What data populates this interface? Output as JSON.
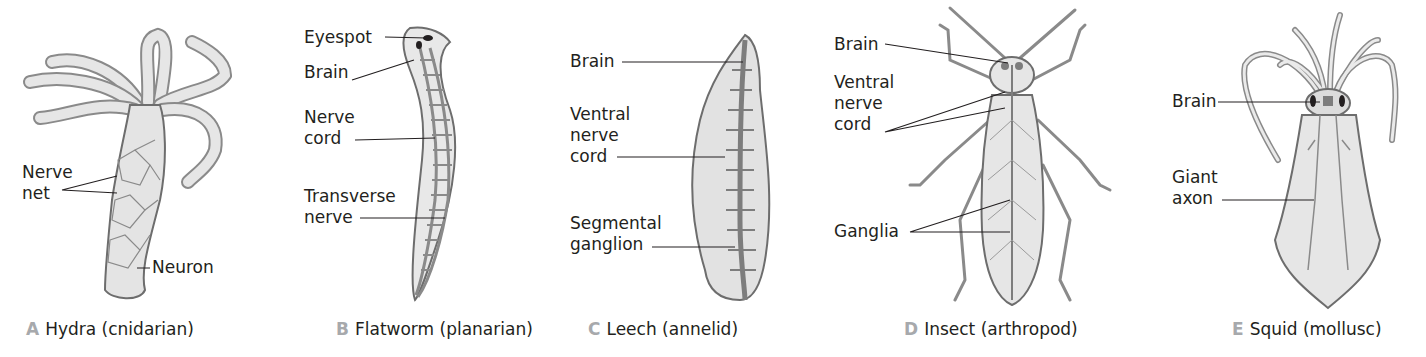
{
  "figure": {
    "panels": [
      {
        "id": "A",
        "letter": "A",
        "caption": "Hydra (cnidarian)",
        "labels": [
          "Nerve\nnet",
          "Neuron"
        ]
      },
      {
        "id": "B",
        "letter": "B",
        "caption": "Flatworm (planarian)",
        "labels": [
          "Eyespot",
          "Brain",
          "Nerve\ncord",
          "Transverse\nnerve"
        ]
      },
      {
        "id": "C",
        "letter": "C",
        "caption": "Leech (annelid)",
        "labels": [
          "Brain",
          "Ventral\nnerve\ncord",
          "Segmental\nganglion"
        ]
      },
      {
        "id": "D",
        "letter": "D",
        "caption": "Insect (arthropod)",
        "labels": [
          "Brain",
          "Ventral\nnerve\ncord",
          "Ganglia"
        ]
      },
      {
        "id": "E",
        "letter": "E",
        "caption": "Squid (mollusc)",
        "labels": [
          "Brain",
          "Giant\naxon"
        ]
      }
    ],
    "colors": {
      "text": "#231f20",
      "caption_letter": "#a7a9ac",
      "body_fill": "#e6e6e6",
      "nerve": "#7d7d7d"
    }
  }
}
